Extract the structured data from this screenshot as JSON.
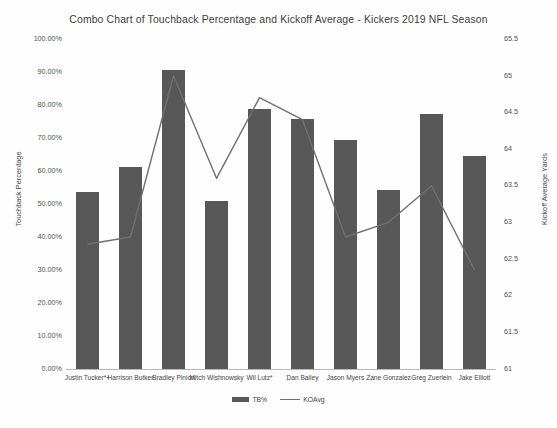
{
  "chart_data": {
    "type": "bar",
    "title": "Combo Chart of Touchback Percentage and Kickoff Average - Kickers 2019 NFL Season",
    "xlabel": "",
    "ylabel": "Touchback Percentage",
    "y2label": "Kickoff Average Yards",
    "ylim": [
      0,
      100
    ],
    "y2lim": [
      61,
      65.5
    ],
    "grid": false,
    "legend_position": "bottom",
    "categories": [
      "Justin Tucker*+",
      "Harrison Butker",
      "Bradley Pinion",
      "Mitch Wishnowsky",
      "Wil Lutz*",
      "Dan Bailey",
      "Jason Myers",
      "Zane Gonzalez",
      "Greg Zuerlein",
      "Jake Elliott"
    ],
    "series": [
      {
        "name": "TB%",
        "type": "bar",
        "axis": "left",
        "color": "#585858",
        "values": [
          53.6,
          61.2,
          90.6,
          51.0,
          78.8,
          75.8,
          69.4,
          54.2,
          77.3,
          64.5
        ]
      },
      {
        "name": "KOAvg",
        "type": "line",
        "axis": "right",
        "color": "#707070",
        "values": [
          62.7,
          62.8,
          65.0,
          63.6,
          64.7,
          64.4,
          62.8,
          63.0,
          63.5,
          62.35
        ]
      }
    ],
    "y_ticks": [
      "100.00%",
      "90.00%",
      "80.00%",
      "70.00%",
      "60.00%",
      "50.00%",
      "40.00%",
      "30.00%",
      "20.00%",
      "10.00%",
      "0.00%"
    ],
    "y2_ticks": [
      "65.5",
      "65",
      "64.5",
      "64",
      "63.5",
      "63",
      "62.5",
      "62",
      "61.5",
      "61"
    ],
    "legend": [
      "TB%",
      "KOAvg"
    ]
  }
}
